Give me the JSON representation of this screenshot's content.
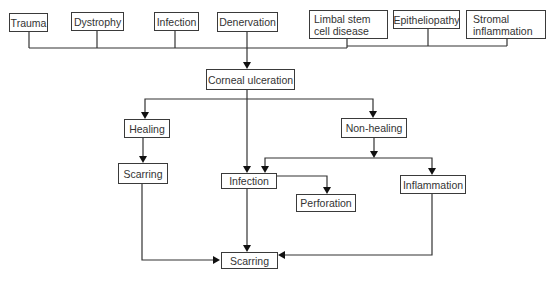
{
  "diagram": {
    "type": "flowchart",
    "causes": [
      {
        "id": "trauma",
        "label": "Trauma"
      },
      {
        "id": "dystrophy",
        "label": "Dystrophy"
      },
      {
        "id": "infection_cause",
        "label": "Infection"
      },
      {
        "id": "denervation",
        "label": "Denervation"
      },
      {
        "id": "limbal",
        "label": "Limbal stem cell disease"
      },
      {
        "id": "epitheliopathy",
        "label": "Epitheliopathy"
      },
      {
        "id": "stromal",
        "label": "Stromal inflammation"
      }
    ],
    "nodes": {
      "corneal_ulceration": "Corneal ulceration",
      "healing": "Healing",
      "non_healing": "Non-healing",
      "scarring_healing": "Scarring",
      "infection": "Infection",
      "perforation": "Perforation",
      "inflammation": "Inflammation",
      "scarring_final": "Scarring"
    },
    "edges": [
      {
        "from": "causes",
        "to": "corneal_ulceration"
      },
      {
        "from": "corneal_ulceration",
        "to": "healing"
      },
      {
        "from": "corneal_ulceration",
        "to": "non_healing"
      },
      {
        "from": "corneal_ulceration",
        "to": "infection"
      },
      {
        "from": "healing",
        "to": "scarring_healing"
      },
      {
        "from": "non_healing",
        "to": "infection"
      },
      {
        "from": "non_healing",
        "to": "inflammation"
      },
      {
        "from": "infection",
        "to": "perforation"
      },
      {
        "from": "infection",
        "to": "scarring_final"
      },
      {
        "from": "scarring_healing",
        "to": "scarring_final"
      },
      {
        "from": "inflammation",
        "to": "scarring_final"
      }
    ]
  }
}
